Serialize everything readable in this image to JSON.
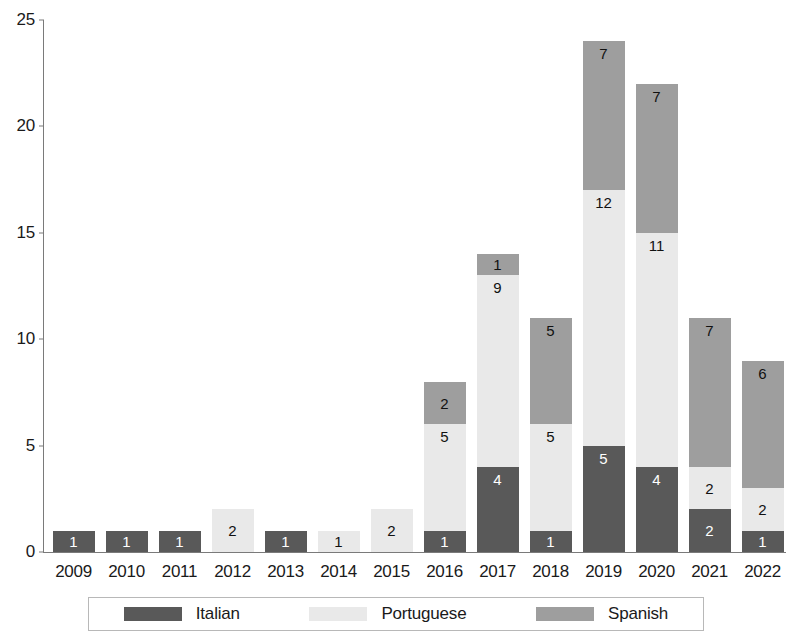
{
  "chart_data": {
    "type": "bar",
    "subtype": "stacked-bar",
    "title": "",
    "xlabel": "",
    "ylabel": "",
    "ylim": [
      0,
      25
    ],
    "yticks": [
      0,
      5,
      10,
      15,
      20,
      25
    ],
    "grid": false,
    "legend_position": "bottom",
    "categories": [
      "2009",
      "2010",
      "2011",
      "2012",
      "2013",
      "2014",
      "2015",
      "2016",
      "2017",
      "2018",
      "2019",
      "2020",
      "2021",
      "2022"
    ],
    "series": [
      {
        "name": "Italian",
        "color": "#595959",
        "values": [
          1,
          1,
          1,
          0,
          1,
          0,
          0,
          1,
          4,
          1,
          5,
          4,
          2,
          1
        ]
      },
      {
        "name": "Portuguese",
        "color": "#e9e9e9",
        "values": [
          0,
          0,
          0,
          2,
          0,
          1,
          2,
          5,
          9,
          5,
          12,
          11,
          2,
          2
        ]
      },
      {
        "name": "Spanish",
        "color": "#9e9e9e",
        "values": [
          0,
          0,
          0,
          0,
          0,
          0,
          0,
          2,
          1,
          5,
          7,
          7,
          7,
          6
        ]
      }
    ],
    "totals": [
      1,
      1,
      1,
      2,
      1,
      1,
      2,
      8,
      14,
      11,
      24,
      22,
      11,
      9
    ]
  },
  "axis": {
    "y_ticks": [
      "0",
      "5",
      "10",
      "15",
      "20",
      "25"
    ]
  },
  "legend": {
    "items": [
      {
        "label": "Italian",
        "color": "#595959"
      },
      {
        "label": "Portuguese",
        "color": "#e9e9e9"
      },
      {
        "label": "Spanish",
        "color": "#9e9e9e"
      }
    ]
  }
}
